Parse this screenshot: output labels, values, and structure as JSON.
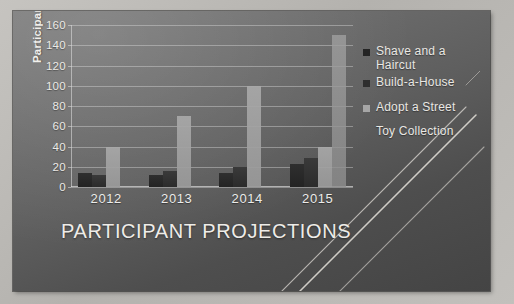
{
  "chart_data": {
    "type": "bar",
    "title": "PARTICIPANT PROJECTIONS",
    "xlabel": "",
    "ylabel": "Participants",
    "categories": [
      "2012",
      "2013",
      "2014",
      "2015"
    ],
    "series": [
      {
        "name": "Shave and a Haircut",
        "color": "#242424",
        "values": [
          14,
          12,
          14,
          23
        ]
      },
      {
        "name": "Build-a-House",
        "color": "#2e2e2e",
        "values": [
          12,
          16,
          20,
          29
        ]
      },
      {
        "name": "Adopt a Street",
        "color": "#a6a6a6",
        "values": [
          40,
          70,
          100,
          40
        ]
      },
      {
        "name": "Toy Collection",
        "color": "#8f8f8f",
        "values": [
          0,
          0,
          0,
          150
        ]
      }
    ],
    "ylim": [
      0,
      160
    ],
    "ytick_step": 20,
    "yticks": [
      "160",
      "140",
      "120",
      "100",
      "80",
      "60",
      "40",
      "20",
      "0"
    ],
    "grid": true,
    "legend_position": "right"
  },
  "legend": {
    "entries": [
      {
        "label_line1": "Shave and a",
        "label_line2": "Haircut"
      },
      {
        "label_line1": "Build-a-House",
        "label_line2": ""
      },
      {
        "label_line1": "Adopt a Street",
        "label_line2": ""
      },
      {
        "label_line1": "Toy Collection",
        "label_line2": ""
      }
    ]
  },
  "theme": {
    "panel_dark": "#5f5f5f",
    "mat_light": "#c0bebb",
    "text_light": "#ececea",
    "grid_color": "#e2e2e2"
  }
}
